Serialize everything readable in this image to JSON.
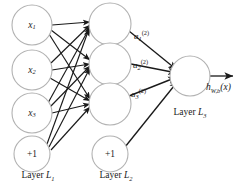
{
  "diagram": {
    "background_color": "#ffffff",
    "node_stroke_color": "#b2b2b2",
    "edge_color": "#1a1a1a",
    "text_color": "#1a1a1a"
  },
  "layers": [
    {
      "id": "L1",
      "label_prefix": "Layer",
      "label_symbol": "L",
      "label_subscript": "1",
      "nodes": [
        {
          "id": "x1",
          "base": "x",
          "subscript": "1",
          "superscript": "",
          "kind": "input"
        },
        {
          "id": "x2",
          "base": "x",
          "subscript": "2",
          "superscript": "",
          "kind": "input"
        },
        {
          "id": "x3",
          "base": "x",
          "subscript": "3",
          "superscript": "",
          "kind": "input"
        },
        {
          "id": "b1",
          "base": "+1",
          "subscript": "",
          "superscript": "",
          "kind": "bias"
        }
      ]
    },
    {
      "id": "L2",
      "label_prefix": "Layer",
      "label_symbol": "L",
      "label_subscript": "2",
      "nodes": [
        {
          "id": "h1",
          "base": "",
          "subscript": "",
          "superscript": "",
          "kind": "hidden"
        },
        {
          "id": "h2",
          "base": "",
          "subscript": "",
          "superscript": "",
          "kind": "hidden"
        },
        {
          "id": "h3",
          "base": "",
          "subscript": "",
          "superscript": "",
          "kind": "hidden"
        },
        {
          "id": "b2",
          "base": "+1",
          "subscript": "",
          "superscript": "",
          "kind": "bias"
        }
      ]
    },
    {
      "id": "L3",
      "label_prefix": "Layer",
      "label_symbol": "L",
      "label_subscript": "3",
      "nodes": [
        {
          "id": "o1",
          "base": "",
          "subscript": "",
          "superscript": "",
          "kind": "output"
        }
      ]
    }
  ],
  "activations": [
    {
      "id": "a1",
      "base": "a",
      "subscript": "1",
      "superscript": "(2)"
    },
    {
      "id": "a2",
      "base": "a",
      "subscript": "2",
      "superscript": "(2)"
    },
    {
      "id": "a3",
      "base": "a",
      "subscript": "3",
      "superscript": "(2)"
    }
  ],
  "output": {
    "base": "h",
    "subscript": "W,b",
    "argument": "(x)"
  }
}
